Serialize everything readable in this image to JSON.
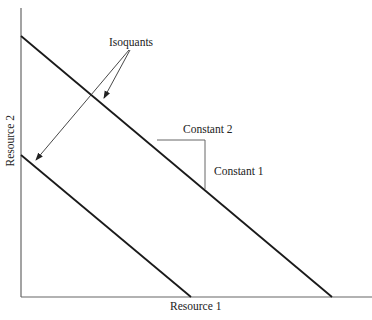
{
  "diagram": {
    "type": "isoquant-diagram",
    "labels": {
      "isoquants": "Isoquants",
      "constant_2": "Constant  2",
      "constant_1": "Constant  1",
      "x_axis": "Resource  1",
      "y_axis": "Resource  2"
    },
    "colors": {
      "line": "#1a1a1a",
      "axis": "#555555",
      "arrow": "#333333"
    },
    "isoquants": [
      {
        "name": "outer",
        "x1": 21,
        "y1": 36,
        "x2": 332,
        "y2": 297
      },
      {
        "name": "inner",
        "x1": 21,
        "y1": 155,
        "x2": 191,
        "y2": 297
      }
    ],
    "slope_bracket": {
      "hx1": 157,
      "hy": 140,
      "hx2": 205,
      "vx": 205,
      "vy2": 189
    }
  }
}
